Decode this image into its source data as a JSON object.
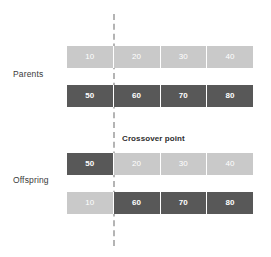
{
  "diagram": {
    "title_caption": "Crossover point",
    "groups": [
      {
        "label": "Parents"
      },
      {
        "label": "Offspring"
      }
    ],
    "rows": [
      {
        "name": "parent-1",
        "group": "Parents",
        "genes": [
          {
            "value": "10",
            "shade": "light"
          },
          {
            "value": "20",
            "shade": "light"
          },
          {
            "value": "30",
            "shade": "light"
          },
          {
            "value": "40",
            "shade": "light"
          }
        ]
      },
      {
        "name": "parent-2",
        "group": "Parents",
        "genes": [
          {
            "value": "50",
            "shade": "dark"
          },
          {
            "value": "60",
            "shade": "dark"
          },
          {
            "value": "70",
            "shade": "dark"
          },
          {
            "value": "80",
            "shade": "dark"
          }
        ]
      },
      {
        "name": "offspring-1",
        "group": "Offspring",
        "genes": [
          {
            "value": "50",
            "shade": "dark"
          },
          {
            "value": "20",
            "shade": "light"
          },
          {
            "value": "30",
            "shade": "light"
          },
          {
            "value": "40",
            "shade": "light"
          }
        ]
      },
      {
        "name": "offspring-2",
        "group": "Offspring",
        "genes": [
          {
            "value": "10",
            "shade": "light"
          },
          {
            "value": "60",
            "shade": "dark"
          },
          {
            "value": "70",
            "shade": "dark"
          },
          {
            "value": "80",
            "shade": "dark"
          }
        ]
      }
    ],
    "crossover": {
      "after_gene_index": 1,
      "line_style": "dashed",
      "line_color": "#b4b4b4"
    },
    "colors": {
      "light_gene": "#c9c9c9",
      "dark_gene": "#585858",
      "gene_text": "#ffffff",
      "label_text": "#3a3a3a",
      "caption_text": "#2e2e2e",
      "background": "#ffffff"
    }
  }
}
